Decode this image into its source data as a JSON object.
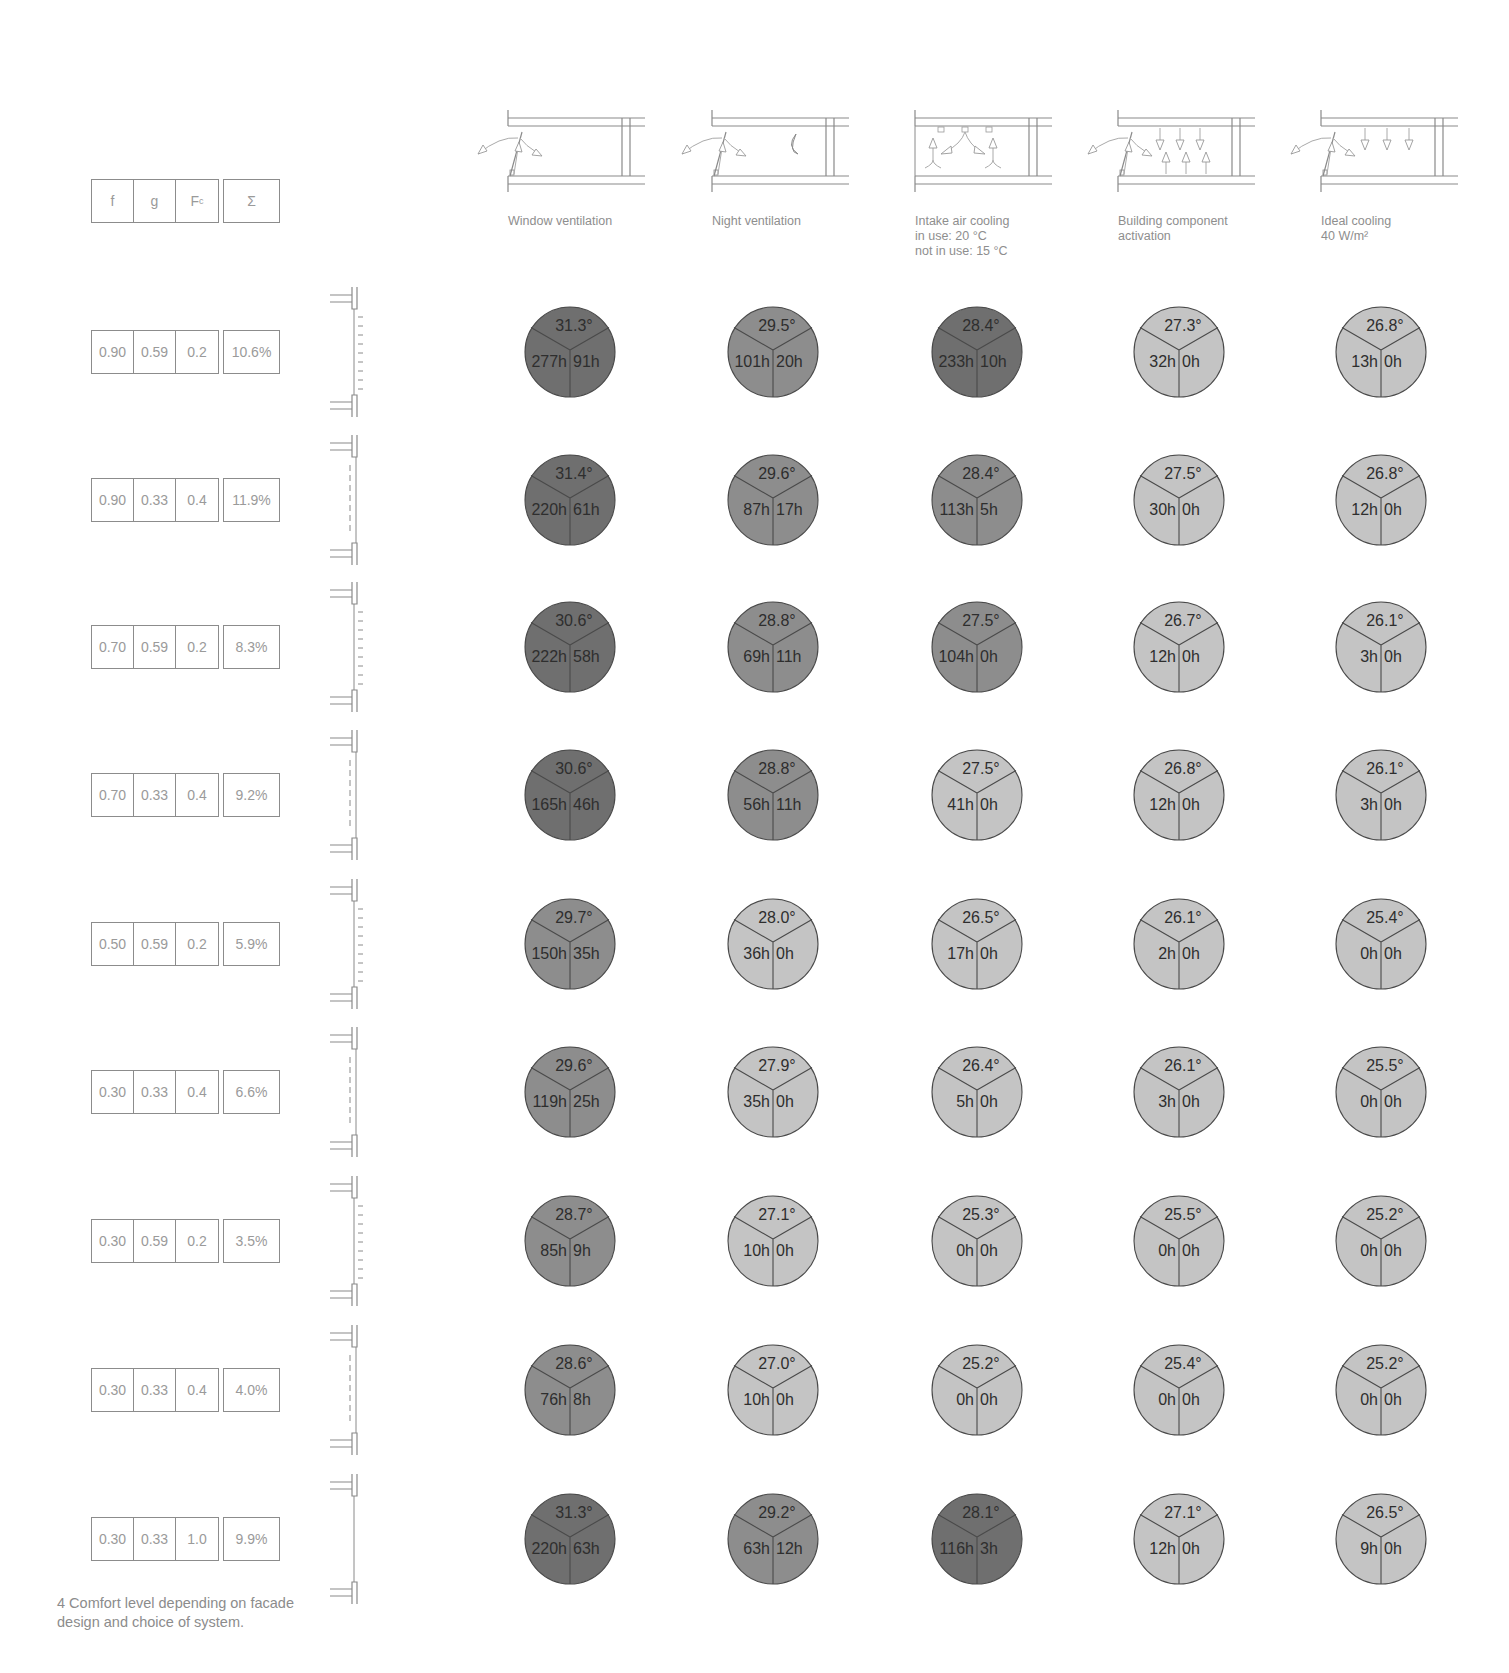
{
  "table_header": {
    "f": "f",
    "g": "g",
    "fc_main": "F",
    "fc_sub": "c",
    "sum": "Σ"
  },
  "columns": [
    {
      "label": "Window ventilation",
      "icon": "window-ventilation-icon"
    },
    {
      "label": "Night ventilation",
      "icon": "night-ventilation-icon"
    },
    {
      "label": "Intake air cooling\nin use: 20 °C\nnot in use: 15 °C",
      "icon": "intake-air-cooling-icon"
    },
    {
      "label": "Building component\nactivation",
      "icon": "building-component-activation-icon"
    },
    {
      "label": "Ideal cooling\n40 W/m²",
      "icon": "ideal-cooling-icon"
    }
  ],
  "colors": {
    "dark": "#6f6f6f",
    "medium": "#8d8d8d",
    "light": "#c4c4c4",
    "stroke": "#4a4a4a"
  },
  "rows": [
    {
      "f": "0.90",
      "g": "0.59",
      "fc": "0.2",
      "sum": "10.6%",
      "facade": "louvres",
      "cells": [
        {
          "temp": "31.3°",
          "h1": "277h",
          "h2": "91h",
          "shade": "dark"
        },
        {
          "temp": "29.5°",
          "h1": "101h",
          "h2": "20h",
          "shade": "medium"
        },
        {
          "temp": "28.4°",
          "h1": "233h",
          "h2": "10h",
          "shade": "dark"
        },
        {
          "temp": "27.3°",
          "h1": "32h",
          "h2": "0h",
          "shade": "light"
        },
        {
          "temp": "26.8°",
          "h1": "13h",
          "h2": "0h",
          "shade": "light"
        }
      ]
    },
    {
      "f": "0.90",
      "g": "0.33",
      "fc": "0.4",
      "sum": "11.9%",
      "facade": "dashed",
      "cells": [
        {
          "temp": "31.4°",
          "h1": "220h",
          "h2": "61h",
          "shade": "dark"
        },
        {
          "temp": "29.6°",
          "h1": "87h",
          "h2": "17h",
          "shade": "medium"
        },
        {
          "temp": "28.4°",
          "h1": "113h",
          "h2": "5h",
          "shade": "medium"
        },
        {
          "temp": "27.5°",
          "h1": "30h",
          "h2": "0h",
          "shade": "light"
        },
        {
          "temp": "26.8°",
          "h1": "12h",
          "h2": "0h",
          "shade": "light"
        }
      ]
    },
    {
      "f": "0.70",
      "g": "0.59",
      "fc": "0.2",
      "sum": "8.3%",
      "facade": "louvres",
      "cells": [
        {
          "temp": "30.6°",
          "h1": "222h",
          "h2": "58h",
          "shade": "dark"
        },
        {
          "temp": "28.8°",
          "h1": "69h",
          "h2": "11h",
          "shade": "medium"
        },
        {
          "temp": "27.5°",
          "h1": "104h",
          "h2": "0h",
          "shade": "medium"
        },
        {
          "temp": "26.7°",
          "h1": "12h",
          "h2": "0h",
          "shade": "light"
        },
        {
          "temp": "26.1°",
          "h1": "3h",
          "h2": "0h",
          "shade": "light"
        }
      ]
    },
    {
      "f": "0.70",
      "g": "0.33",
      "fc": "0.4",
      "sum": "9.2%",
      "facade": "dashed",
      "cells": [
        {
          "temp": "30.6°",
          "h1": "165h",
          "h2": "46h",
          "shade": "dark"
        },
        {
          "temp": "28.8°",
          "h1": "56h",
          "h2": "11h",
          "shade": "medium"
        },
        {
          "temp": "27.5°",
          "h1": "41h",
          "h2": "0h",
          "shade": "light"
        },
        {
          "temp": "26.8°",
          "h1": "12h",
          "h2": "0h",
          "shade": "light"
        },
        {
          "temp": "26.1°",
          "h1": "3h",
          "h2": "0h",
          "shade": "light"
        }
      ]
    },
    {
      "f": "0.50",
      "g": "0.59",
      "fc": "0.2",
      "sum": "5.9%",
      "facade": "louvres",
      "cells": [
        {
          "temp": "29.7°",
          "h1": "150h",
          "h2": "35h",
          "shade": "medium"
        },
        {
          "temp": "28.0°",
          "h1": "36h",
          "h2": "0h",
          "shade": "light"
        },
        {
          "temp": "26.5°",
          "h1": "17h",
          "h2": "0h",
          "shade": "light"
        },
        {
          "temp": "26.1°",
          "h1": "2h",
          "h2": "0h",
          "shade": "light"
        },
        {
          "temp": "25.4°",
          "h1": "0h",
          "h2": "0h",
          "shade": "light"
        }
      ]
    },
    {
      "f": "0.30",
      "g": "0.33",
      "fc": "0.4",
      "sum": "6.6%",
      "facade": "dashed",
      "cells": [
        {
          "temp": "29.6°",
          "h1": "119h",
          "h2": "25h",
          "shade": "medium"
        },
        {
          "temp": "27.9°",
          "h1": "35h",
          "h2": "0h",
          "shade": "light"
        },
        {
          "temp": "26.4°",
          "h1": "5h",
          "h2": "0h",
          "shade": "light"
        },
        {
          "temp": "26.1°",
          "h1": "3h",
          "h2": "0h",
          "shade": "light"
        },
        {
          "temp": "25.5°",
          "h1": "0h",
          "h2": "0h",
          "shade": "light"
        }
      ]
    },
    {
      "f": "0.30",
      "g": "0.59",
      "fc": "0.2",
      "sum": "3.5%",
      "facade": "louvres",
      "cells": [
        {
          "temp": "28.7°",
          "h1": "85h",
          "h2": "9h",
          "shade": "medium"
        },
        {
          "temp": "27.1°",
          "h1": "10h",
          "h2": "0h",
          "shade": "light"
        },
        {
          "temp": "25.3°",
          "h1": "0h",
          "h2": "0h",
          "shade": "light"
        },
        {
          "temp": "25.5°",
          "h1": "0h",
          "h2": "0h",
          "shade": "light"
        },
        {
          "temp": "25.2°",
          "h1": "0h",
          "h2": "0h",
          "shade": "light"
        }
      ]
    },
    {
      "f": "0.30",
      "g": "0.33",
      "fc": "0.4",
      "sum": "4.0%",
      "facade": "dashed",
      "cells": [
        {
          "temp": "28.6°",
          "h1": "76h",
          "h2": "8h",
          "shade": "medium"
        },
        {
          "temp": "27.0°",
          "h1": "10h",
          "h2": "0h",
          "shade": "light"
        },
        {
          "temp": "25.2°",
          "h1": "0h",
          "h2": "0h",
          "shade": "light"
        },
        {
          "temp": "25.4°",
          "h1": "0h",
          "h2": "0h",
          "shade": "light"
        },
        {
          "temp": "25.2°",
          "h1": "0h",
          "h2": "0h",
          "shade": "light"
        }
      ]
    },
    {
      "f": "0.30",
      "g": "0.33",
      "fc": "1.0",
      "sum": "9.9%",
      "facade": "plain",
      "cells": [
        {
          "temp": "31.3°",
          "h1": "220h",
          "h2": "63h",
          "shade": "dark"
        },
        {
          "temp": "29.2°",
          "h1": "63h",
          "h2": "12h",
          "shade": "medium"
        },
        {
          "temp": "28.1°",
          "h1": "116h",
          "h2": "3h",
          "shade": "dark"
        },
        {
          "temp": "27.1°",
          "h1": "12h",
          "h2": "0h",
          "shade": "light"
        },
        {
          "temp": "26.5°",
          "h1": "9h",
          "h2": "0h",
          "shade": "light"
        }
      ]
    }
  ],
  "caption": "4 Comfort level depending on facade\ndesign and choice of system."
}
